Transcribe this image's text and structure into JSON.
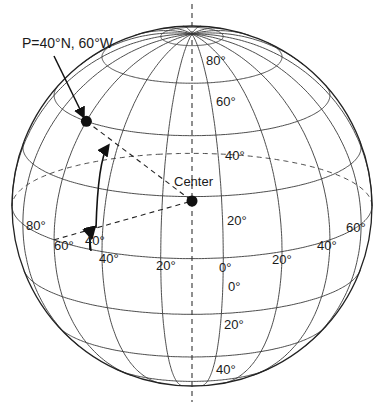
{
  "diagram": {
    "type": "globe-graticule",
    "point_label": "P=40°N, 60°W",
    "center_label": "Center",
    "angle_label": "40°",
    "latitude_labels_upper": [
      "80°",
      "60°",
      "40°",
      "20°"
    ],
    "latitude_labels_lower": [
      "0°",
      "20°",
      "40°"
    ],
    "longitude_labels": [
      "80°",
      "60°",
      "40°",
      "20°",
      "0°",
      "20°",
      "40°",
      "60°"
    ],
    "colors": {
      "line": "#3a3a3a",
      "outline": "#222222",
      "dot": "#111111",
      "background": "#ffffff"
    },
    "geometry": {
      "center_x": 192,
      "center_y": 206,
      "radius": 180,
      "view_latitude_deg": 17,
      "view_longitude_deg": -10,
      "parallel_step_deg": 20,
      "meridian_step_deg": 20
    }
  }
}
